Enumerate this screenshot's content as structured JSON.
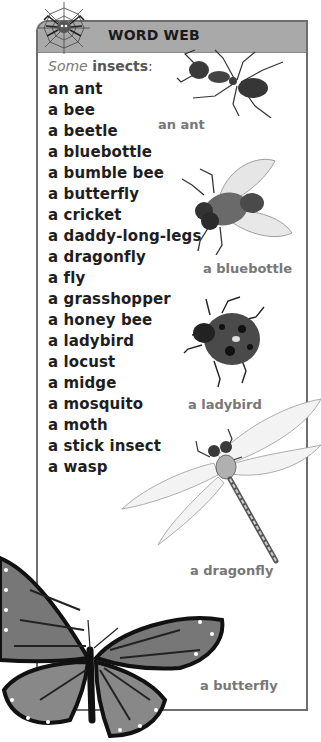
{
  "header": {
    "title": "WORD WEB",
    "icon": "spider-web-icon"
  },
  "intro": {
    "prefix": "Some",
    "keyword": "insects",
    "suffix": ":"
  },
  "list": [
    "an ant",
    "a bee",
    "a beetle",
    "a bluebottle",
    "a bumble bee",
    "a butterfly",
    "a cricket",
    "a daddy-long-legs",
    "a dragonfly",
    "a fly",
    "a grasshopper",
    "a honey bee",
    "a ladybird",
    "a locust",
    "a midge",
    "a mosquito",
    "a moth",
    "a stick insect",
    "a wasp"
  ],
  "illustrations": [
    {
      "id": "ant",
      "caption": "an ant"
    },
    {
      "id": "bluebottle",
      "caption": "a bluebottle"
    },
    {
      "id": "ladybird",
      "caption": "a ladybird"
    },
    {
      "id": "dragonfly",
      "caption": "a dragonfly"
    },
    {
      "id": "butterfly",
      "caption": "a butterfly"
    }
  ],
  "colors": {
    "header": "#a9a9a9",
    "border": "#6e6e6e",
    "text": "#1e1e1e",
    "caption": "#777777"
  }
}
